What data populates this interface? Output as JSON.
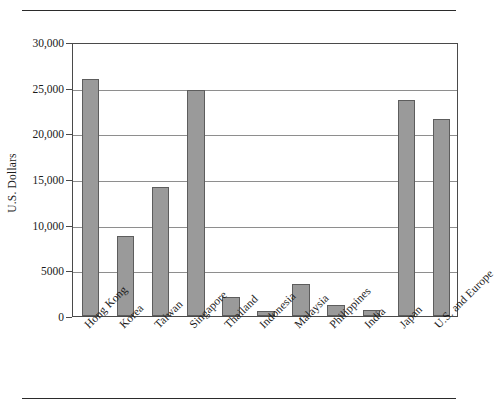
{
  "chart_data": {
    "type": "bar",
    "title": "",
    "xlabel": "",
    "ylabel": "U.S. Dollars",
    "ylim": [
      0,
      30000
    ],
    "ytick_labels": [
      "0",
      "5000",
      "10,000",
      "15,000",
      "20,000",
      "25,000",
      "30,000"
    ],
    "ytick_values": [
      0,
      5000,
      10000,
      15000,
      20000,
      25000,
      30000
    ],
    "grid": true,
    "legend": "none",
    "categories": [
      "Hong Kong",
      "Korea",
      "Taiwan",
      "Singapore",
      "Thailand",
      "Indonesia",
      "Malaysia",
      "Philippines",
      "India",
      "Japan",
      "U.S. and Europe"
    ],
    "values": [
      26000,
      8800,
      14100,
      24700,
      2100,
      500,
      3500,
      1200,
      650,
      23700,
      21600
    ],
    "bar_color": "#9a9a9a",
    "bar_edge_color": "#5d5d5d"
  }
}
